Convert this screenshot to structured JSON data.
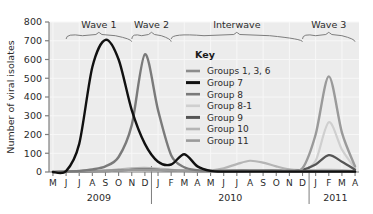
{
  "chart_data": {
    "type": "line",
    "title": "",
    "xlabel": "",
    "ylabel": "Number of viral isolates",
    "ylim": [
      0,
      800
    ],
    "yticks": [
      0,
      100,
      200,
      300,
      400,
      500,
      600,
      700,
      800
    ],
    "grid": true,
    "legend_position": "inside-top-center",
    "legend_title": "Key",
    "x_months": [
      "M",
      "J",
      "J",
      "A",
      "S",
      "O",
      "N",
      "D",
      "J",
      "F",
      "M",
      "A",
      "M",
      "J",
      "J",
      "A",
      "S",
      "O",
      "N",
      "D",
      "J",
      "F",
      "M",
      "A"
    ],
    "years": [
      {
        "label": "2009",
        "start_index": 0,
        "end_index": 7
      },
      {
        "label": "2010",
        "start_index": 8,
        "end_index": 19
      },
      {
        "label": "2011",
        "start_index": 20,
        "end_index": 23
      }
    ],
    "annotations": [
      {
        "label": "Wave 1",
        "start_index": 1,
        "end_index": 6
      },
      {
        "label": "Wave 2",
        "start_index": 6,
        "end_index": 9
      },
      {
        "label": "Interwave",
        "start_index": 9,
        "end_index": 19
      },
      {
        "label": "Wave 3",
        "start_index": 19,
        "end_index": 23
      }
    ],
    "series": [
      {
        "name": "Groups 1, 3, 6",
        "color": "#8c8c8c",
        "width": 2.0,
        "values": [
          0,
          2,
          4,
          6,
          8,
          10,
          12,
          10,
          8,
          6,
          5,
          4,
          4,
          4,
          5,
          6,
          6,
          5,
          4,
          4,
          6,
          8,
          6,
          3
        ]
      },
      {
        "name": "Group 7",
        "color": "#111111",
        "width": 2.4,
        "values": [
          0,
          5,
          150,
          560,
          705,
          600,
          330,
          150,
          55,
          40,
          95,
          30,
          6,
          2,
          2,
          2,
          2,
          2,
          2,
          2,
          2,
          2,
          2,
          2
        ]
      },
      {
        "name": "Group 8",
        "color": "#7a7a7a",
        "width": 2.4,
        "values": [
          0,
          2,
          6,
          14,
          30,
          80,
          250,
          628,
          330,
          90,
          25,
          10,
          6,
          5,
          5,
          6,
          6,
          5,
          4,
          4,
          4,
          4,
          4,
          3
        ]
      },
      {
        "name": "Group 8-1",
        "color": "#cfcfcf",
        "width": 2.2,
        "values": [
          0,
          1,
          2,
          3,
          4,
          6,
          8,
          10,
          10,
          8,
          6,
          5,
          5,
          6,
          8,
          10,
          8,
          6,
          5,
          8,
          60,
          265,
          120,
          20
        ]
      },
      {
        "name": "Group 9",
        "color": "#555555",
        "width": 2.2,
        "values": [
          0,
          1,
          2,
          3,
          5,
          8,
          12,
          14,
          12,
          8,
          6,
          5,
          5,
          6,
          8,
          10,
          10,
          8,
          6,
          12,
          40,
          90,
          55,
          12
        ]
      },
      {
        "name": "Group 10",
        "color": "#b5b5b5",
        "width": 2.2,
        "values": [
          0,
          1,
          2,
          4,
          8,
          14,
          20,
          22,
          18,
          12,
          8,
          6,
          8,
          20,
          42,
          60,
          50,
          30,
          14,
          10,
          10,
          12,
          10,
          5
        ]
      },
      {
        "name": "Group 11",
        "color": "#9a9a9a",
        "width": 2.4,
        "values": [
          0,
          1,
          2,
          3,
          5,
          8,
          10,
          12,
          10,
          8,
          6,
          5,
          5,
          6,
          8,
          10,
          10,
          8,
          6,
          20,
          200,
          510,
          210,
          30
        ]
      }
    ]
  },
  "legend": {
    "title": "Key",
    "items": [
      {
        "label": "Groups 1, 3, 6",
        "color": "#8c8c8c"
      },
      {
        "label": "Group 7",
        "color": "#111111"
      },
      {
        "label": "Group 8",
        "color": "#7a7a7a"
      },
      {
        "label": "Group 8-1",
        "color": "#cfcfcf"
      },
      {
        "label": "Group 9",
        "color": "#555555"
      },
      {
        "label": "Group 10",
        "color": "#b5b5b5"
      },
      {
        "label": "Group 11",
        "color": "#9a9a9a"
      }
    ]
  },
  "style": {
    "plot_background": "#ececec",
    "grid_color": "#f7f7f7",
    "axis_color": "#7d7d7d",
    "text_color": "#2b2b2b"
  }
}
